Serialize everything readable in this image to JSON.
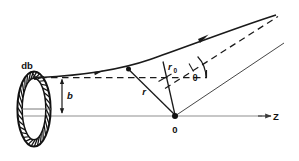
{
  "figure": {
    "background_color": "#ffffff",
    "line_color": "#1a1a1a",
    "axis_color": "#8a8a8a"
  },
  "labels": {
    "annulus_width": "db",
    "impact_parameter": "b",
    "radius": "r",
    "closest_approach": "r",
    "closest_approach_sub": "0",
    "scattering_angle": "θ",
    "origin": "0",
    "axis": "Z"
  },
  "elements": {
    "annulus": {
      "name": "annular-target-ring",
      "center_x": 34,
      "center_y": 109,
      "outer_rx": 17,
      "outer_ry": 38,
      "inner_rx": 12,
      "inner_ry": 31,
      "hatch_count": 34
    },
    "axis_z": {
      "name": "z-axis",
      "x1": 24,
      "y1": 116,
      "x2": 270,
      "y2": 116
    },
    "origin_point": {
      "x": 175,
      "y": 116
    },
    "trajectory": {
      "name": "hyperbolic-trajectory",
      "start_x": 40,
      "start_y": 77,
      "end_x": 277,
      "end_y": 16
    },
    "asymptote_in": {
      "name": "incoming-asymptote-dashed",
      "x1": 40,
      "y1": 77,
      "x2": 206,
      "y2": 77
    },
    "asymptote_out": {
      "name": "outgoing-asymptote-dashed",
      "x1": 168,
      "y1": 89,
      "x2": 277,
      "y2": 16
    },
    "ray_outgoing": {
      "name": "outgoing-ray-from-origin",
      "x1": 175,
      "y1": 116,
      "x2": 282,
      "y2": 44
    },
    "ray_r": {
      "name": "radius-vector-r",
      "x1": 175,
      "y1": 116,
      "x2": 128,
      "y2": 71
    },
    "ray_r0": {
      "name": "closest-approach-vector-r0",
      "x1": 175,
      "y1": 116,
      "x2": 163,
      "y2": 62
    },
    "b_arrow": {
      "name": "impact-parameter-arrow",
      "x": 62,
      "y_top": 79,
      "y_bottom": 114
    },
    "theta_arc": {
      "name": "scattering-angle-arc",
      "radius": 26
    }
  }
}
